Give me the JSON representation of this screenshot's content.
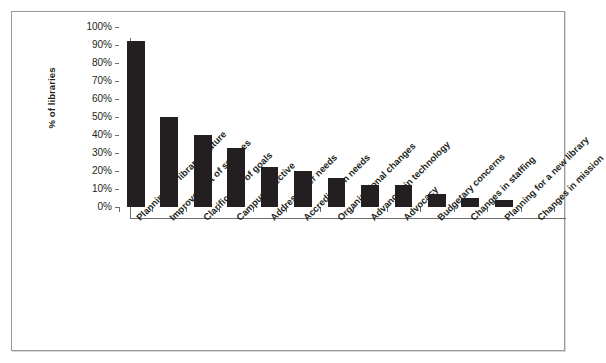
{
  "chart_data": {
    "type": "bar",
    "title": "",
    "xlabel": "",
    "ylabel": "% of libraries",
    "ylim": [
      0,
      100
    ],
    "ytick_labels": [
      "100%",
      "90%",
      "80%",
      "70%",
      "60%",
      "50%",
      "40%",
      "30%",
      "20%",
      "10%",
      "0%"
    ],
    "ytick_values": [
      100,
      90,
      80,
      70,
      60,
      50,
      40,
      30,
      20,
      10,
      0
    ],
    "grid": true,
    "legend": false,
    "bar_color": "#231f20",
    "categories": [
      "Planning for library's future",
      "Improvement of services",
      "Clarification of goals",
      "Campus directive",
      "Address user needs",
      "Accreditation needs",
      "Organizational changes",
      "Advances in technology",
      "Advocacy",
      "Budgetary concerns",
      "Changes in staffing",
      "Planning for a new library",
      "Changes in mission"
    ],
    "values": [
      92,
      50,
      40,
      33,
      22,
      20,
      16,
      12,
      12,
      7,
      5,
      4,
      0
    ]
  }
}
